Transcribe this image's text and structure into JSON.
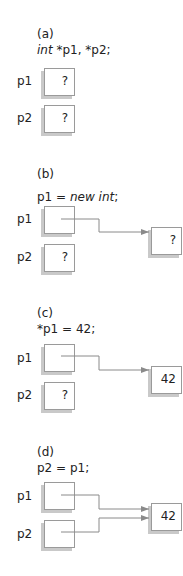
{
  "panels": [
    {
      "tag": "(a)",
      "code": {
        "pre": "",
        "kw1": "int",
        "mid": " *p1, *p2;",
        "kw2": "",
        "post": ""
      },
      "p1": {
        "label": "p1",
        "value": "?"
      },
      "p2": {
        "label": "p2",
        "value": "?"
      }
    },
    {
      "tag": "(b)",
      "code": {
        "pre": "p1 = ",
        "kw1": "new",
        "mid": " ",
        "kw2": "int",
        "post": ";"
      },
      "p1": {
        "label": "p1",
        "value": ""
      },
      "p2": {
        "label": "p2",
        "value": "?"
      },
      "target": {
        "value": "?"
      }
    },
    {
      "tag": "(c)",
      "code": {
        "pre": "*p1 = 42;",
        "kw1": "",
        "mid": "",
        "kw2": "",
        "post": ""
      },
      "p1": {
        "label": "p1",
        "value": ""
      },
      "p2": {
        "label": "p2",
        "value": "?"
      },
      "target": {
        "value": "42"
      }
    },
    {
      "tag": "(d)",
      "code": {
        "pre": "p2 = p1;",
        "kw1": "",
        "mid": "",
        "kw2": "",
        "post": ""
      },
      "p1": {
        "label": "p1",
        "value": ""
      },
      "p2": {
        "label": "p2",
        "value": ""
      },
      "target": {
        "value": "42"
      }
    }
  ]
}
